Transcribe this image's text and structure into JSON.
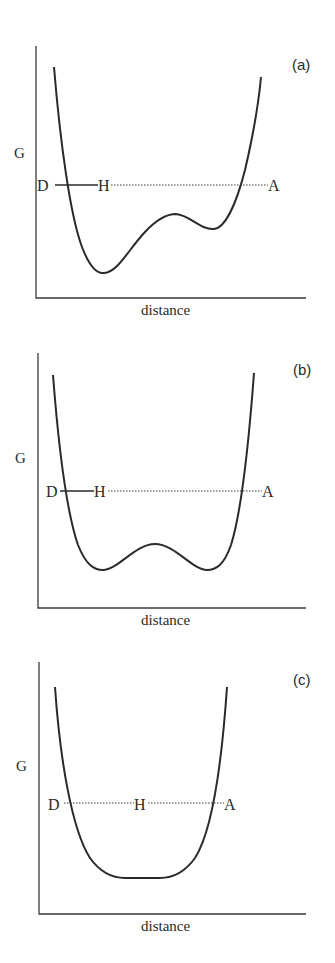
{
  "panels": [
    {
      "label": "(a)",
      "ylabel": "G",
      "xlabel": "distance",
      "donor": "D",
      "hydrogen": "H",
      "acceptor": "A",
      "description": "Asymmetric double-well potential; deep minimum near donor, shallower minimum near acceptor; D–H bond solid, H···A dotted"
    },
    {
      "label": "(b)",
      "ylabel": "G",
      "xlabel": "distance",
      "donor": "D",
      "hydrogen": "H",
      "acceptor": "A",
      "description": "Symmetric double-well potential with low central barrier; D–H bond solid, H···A dotted"
    },
    {
      "label": "(c)",
      "ylabel": "G",
      "xlabel": "distance",
      "donor": "D",
      "hydrogen": "H",
      "acceptor": "A",
      "description": "Single-well flat-bottomed potential; H centered, D···H···A both dotted"
    }
  ],
  "colors": {
    "ink": "#2a2a2a",
    "background": "#ffffff"
  }
}
